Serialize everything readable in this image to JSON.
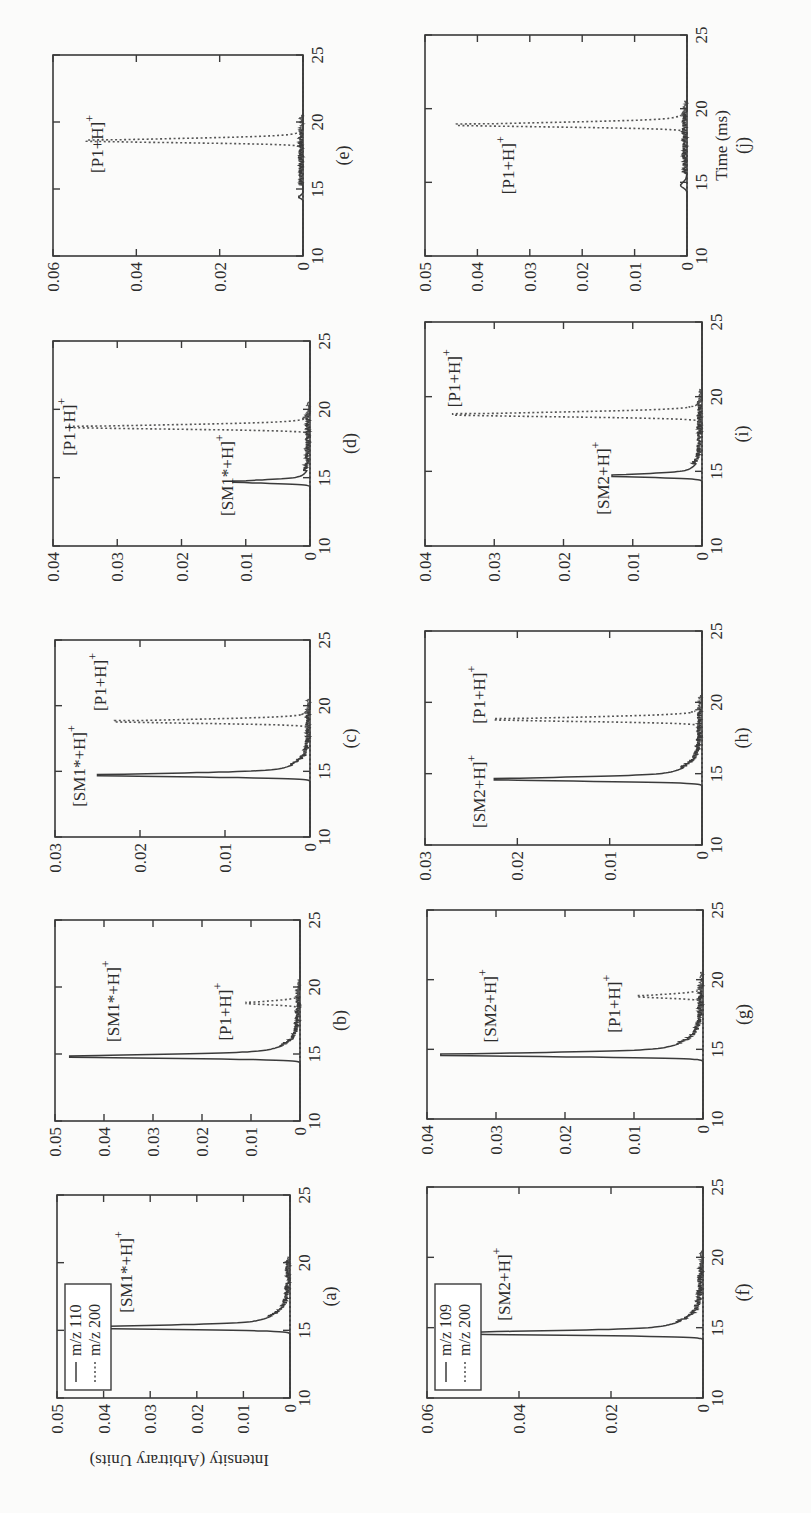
{
  "figure": {
    "y_axis_label": "Intensity (Arbitrary Units)",
    "x_axis_label": "Time (ms)",
    "colors": {
      "axis": "#3a3a3a",
      "solid_trace": "#3b3b3b",
      "dotted_trace": "#555555",
      "background": "#fbfbfa"
    }
  },
  "chart_data": [
    {
      "id": "a",
      "panel_label": "(a)",
      "type": "line",
      "xlabel": "",
      "ylabel": "Intensity (Arbitrary Units)",
      "xlim": [
        10,
        25
      ],
      "ylim": [
        0,
        0.05
      ],
      "xticks": [
        10,
        15,
        20,
        25
      ],
      "yticks": [
        0,
        0.01,
        0.02,
        0.03,
        0.04,
        0.05
      ],
      "ytick_labels": [
        "0",
        "0.01",
        "0.02",
        "0.03",
        "0.04",
        "0.05"
      ],
      "legend": [
        {
          "name": "m/z 110",
          "style": "solid"
        },
        {
          "name": "m/z 200",
          "style": "dotted"
        }
      ],
      "series": [
        {
          "name": "m/z 110",
          "style": "solid",
          "peak_time": 15.2,
          "peak_height": 0.047,
          "width": 0.35,
          "tail": 1.0
        },
        {
          "name": "m/z 200",
          "style": "dotted",
          "peak_time": 18.7,
          "peak_height": 0.0,
          "width": 0.3,
          "tail": 0.4
        }
      ],
      "annotations": [
        {
          "text": "[SM1*+H]",
          "sup": "+",
          "x": 16.3,
          "y": 0.034
        }
      ]
    },
    {
      "id": "b",
      "panel_label": "(b)",
      "type": "line",
      "xlim": [
        10,
        25
      ],
      "ylim": [
        0,
        0.05
      ],
      "xticks": [
        10,
        15,
        20,
        25
      ],
      "yticks": [
        0,
        0.01,
        0.02,
        0.03,
        0.04,
        0.05
      ],
      "ytick_labels": [
        "0",
        "0.01",
        "0.02",
        "0.03",
        "0.04",
        "0.05"
      ],
      "series": [
        {
          "name": "m/z 110",
          "style": "solid",
          "peak_time": 14.8,
          "peak_height": 0.047,
          "width": 0.35,
          "tail": 0.9
        },
        {
          "name": "m/z 200",
          "style": "dotted",
          "peak_time": 18.8,
          "peak_height": 0.011,
          "width": 0.35,
          "tail": 0.3
        }
      ],
      "annotations": [
        {
          "text": "[SM1*+H]",
          "sup": "+",
          "x": 15.9,
          "y": 0.037
        },
        {
          "text": "[P1+H]",
          "sup": "+",
          "x": 16.0,
          "y": 0.014
        }
      ]
    },
    {
      "id": "c",
      "panel_label": "(c)",
      "type": "line",
      "xlim": [
        10,
        25
      ],
      "ylim": [
        0,
        0.03
      ],
      "xticks": [
        10,
        15,
        20,
        25
      ],
      "yticks": [
        0,
        0.01,
        0.02,
        0.03
      ],
      "ytick_labels": [
        "0",
        "0.01",
        "0.02",
        "0.03"
      ],
      "series": [
        {
          "name": "m/z 110",
          "style": "solid",
          "peak_time": 14.7,
          "peak_height": 0.025,
          "width": 0.35,
          "tail": 0.9
        },
        {
          "name": "m/z 200",
          "style": "dotted",
          "peak_time": 18.8,
          "peak_height": 0.023,
          "width": 0.4,
          "tail": 0.3
        }
      ],
      "annotations": [
        {
          "text": "[SM1*+H]",
          "sup": "+",
          "x": 12.3,
          "y": 0.0265
        },
        {
          "text": "[P1+H]",
          "sup": "+",
          "x": 19.6,
          "y": 0.024
        }
      ]
    },
    {
      "id": "d",
      "panel_label": "(d)",
      "type": "line",
      "xlim": [
        10,
        25
      ],
      "ylim": [
        0,
        0.04
      ],
      "xticks": [
        10,
        15,
        20,
        25
      ],
      "yticks": [
        0,
        0.01,
        0.02,
        0.03,
        0.04
      ],
      "ytick_labels": [
        "0",
        "0.01",
        "0.02",
        "0.03",
        "0.04"
      ],
      "series": [
        {
          "name": "m/z 110",
          "style": "solid",
          "peak_time": 14.7,
          "peak_height": 0.012,
          "width": 0.3,
          "tail": 0.6
        },
        {
          "name": "m/z 200",
          "style": "dotted",
          "peak_time": 18.7,
          "peak_height": 0.038,
          "width": 0.4,
          "tail": 0.3
        }
      ],
      "annotations": [
        {
          "text": "[SM1*+H]",
          "sup": "+",
          "x": 12.2,
          "y": 0.012
        },
        {
          "text": "[P1+H]",
          "sup": "+",
          "x": 16.6,
          "y": 0.0365
        }
      ]
    },
    {
      "id": "e",
      "panel_label": "(e)",
      "type": "line",
      "xlim": [
        10,
        25
      ],
      "ylim": [
        0,
        0.06
      ],
      "xticks": [
        10,
        15,
        20,
        25
      ],
      "yticks": [
        0,
        0.02,
        0.04,
        0.06
      ],
      "ytick_labels": [
        "0",
        "0.02",
        "0.04",
        "0.06"
      ],
      "series": [
        {
          "name": "m/z 110",
          "style": "solid",
          "peak_time": 14.4,
          "peak_height": 0.001,
          "width": 0.3,
          "tail": 0.2
        },
        {
          "name": "m/z 200",
          "style": "dotted",
          "peak_time": 18.6,
          "peak_height": 0.052,
          "width": 0.4,
          "tail": 0.3
        }
      ],
      "annotations": [
        {
          "text": "[P1+H]",
          "sup": "+",
          "x": 16.2,
          "y": 0.048
        }
      ]
    },
    {
      "id": "f",
      "panel_label": "(f)",
      "type": "line",
      "xlim": [
        10,
        25
      ],
      "ylim": [
        0,
        0.06
      ],
      "xticks": [
        10,
        15,
        20,
        25
      ],
      "yticks": [
        0,
        0.02,
        0.04,
        0.06
      ],
      "ytick_labels": [
        "0",
        "0.02",
        "0.04",
        "0.06"
      ],
      "legend": [
        {
          "name": "m/z 109",
          "style": "solid"
        },
        {
          "name": "m/z 200",
          "style": "dotted"
        }
      ],
      "series": [
        {
          "name": "m/z 109",
          "style": "solid",
          "peak_time": 14.6,
          "peak_height": 0.058,
          "width": 0.35,
          "tail": 1.0
        },
        {
          "name": "m/z 200",
          "style": "dotted",
          "peak_time": 18.7,
          "peak_height": 0.0,
          "width": 0.3,
          "tail": 0.3
        }
      ],
      "annotations": [
        {
          "text": "[SM2+H]",
          "sup": "+",
          "x": 15.5,
          "y": 0.042
        }
      ]
    },
    {
      "id": "g",
      "panel_label": "(g)",
      "type": "line",
      "xlim": [
        10,
        25
      ],
      "ylim": [
        0,
        0.04
      ],
      "xticks": [
        10,
        15,
        20,
        25
      ],
      "yticks": [
        0,
        0.01,
        0.02,
        0.03,
        0.04
      ],
      "ytick_labels": [
        "0",
        "0.01",
        "0.02",
        "0.03",
        "0.04"
      ],
      "series": [
        {
          "name": "m/z 109",
          "style": "solid",
          "peak_time": 14.6,
          "peak_height": 0.038,
          "width": 0.35,
          "tail": 1.0
        },
        {
          "name": "m/z 200",
          "style": "dotted",
          "peak_time": 18.8,
          "peak_height": 0.0095,
          "width": 0.35,
          "tail": 0.3
        }
      ],
      "annotations": [
        {
          "text": "[SM2+H]",
          "sup": "+",
          "x": 15.5,
          "y": 0.03
        },
        {
          "text": "[P1+H]",
          "sup": "+",
          "x": 16.2,
          "y": 0.012
        }
      ]
    },
    {
      "id": "h",
      "panel_label": "(h)",
      "type": "line",
      "xlim": [
        10,
        25
      ],
      "ylim": [
        0,
        0.03
      ],
      "xticks": [
        10,
        15,
        20,
        25
      ],
      "yticks": [
        0,
        0.01,
        0.02,
        0.03
      ],
      "ytick_labels": [
        "0",
        "0.01",
        "0.02",
        "0.03"
      ],
      "series": [
        {
          "name": "m/z 109",
          "style": "solid",
          "peak_time": 14.6,
          "peak_height": 0.0225,
          "width": 0.35,
          "tail": 1.0
        },
        {
          "name": "m/z 200",
          "style": "dotted",
          "peak_time": 18.8,
          "peak_height": 0.0225,
          "width": 0.4,
          "tail": 0.3
        }
      ],
      "annotations": [
        {
          "text": "[SM2+H]",
          "sup": "+",
          "x": 11.2,
          "y": 0.0235
        },
        {
          "text": "[P1+H]",
          "sup": "+",
          "x": 18.5,
          "y": 0.0235
        }
      ]
    },
    {
      "id": "i",
      "panel_label": "(i)",
      "type": "line",
      "xlim": [
        10,
        25
      ],
      "ylim": [
        0,
        0.04
      ],
      "xticks": [
        10,
        15,
        20,
        25
      ],
      "yticks": [
        0,
        0.01,
        0.02,
        0.03,
        0.04
      ],
      "ytick_labels": [
        "0",
        "0.01",
        "0.02",
        "0.03",
        "0.04"
      ],
      "series": [
        {
          "name": "m/z 109",
          "style": "solid",
          "peak_time": 14.7,
          "peak_height": 0.013,
          "width": 0.3,
          "tail": 0.8
        },
        {
          "name": "m/z 200",
          "style": "dotted",
          "peak_time": 18.8,
          "peak_height": 0.036,
          "width": 0.4,
          "tail": 0.3
        }
      ],
      "annotations": [
        {
          "text": "[SM2+H]",
          "sup": "+",
          "x": 12.1,
          "y": 0.0135
        },
        {
          "text": "[P1+H]",
          "sup": "+",
          "x": 19.3,
          "y": 0.035
        }
      ]
    },
    {
      "id": "j",
      "panel_label": "(j)",
      "type": "line",
      "xlabel": "Time (ms)",
      "xlim": [
        10,
        25
      ],
      "ylim": [
        0,
        0.05
      ],
      "xticks": [
        10,
        15,
        20,
        25
      ],
      "yticks": [
        0,
        0.01,
        0.02,
        0.03,
        0.04,
        0.05
      ],
      "ytick_labels": [
        "0",
        "0.01",
        "0.02",
        "0.03",
        "0.04",
        "0.05"
      ],
      "series": [
        {
          "name": "m/z 109",
          "style": "solid",
          "peak_time": 14.8,
          "peak_height": 0.0012,
          "width": 0.5,
          "tail": 0.6
        },
        {
          "name": "m/z 200",
          "style": "dotted",
          "peak_time": 18.9,
          "peak_height": 0.044,
          "width": 0.4,
          "tail": 0.3
        }
      ],
      "annotations": [
        {
          "text": "[P1+H]",
          "sup": "+",
          "x": 14.2,
          "y": 0.033
        }
      ]
    }
  ],
  "layout": {
    "panels": [
      {
        "id": "a",
        "u": 115,
        "v": 57,
        "w": 203,
        "h": 233
      },
      {
        "id": "b",
        "u": 392,
        "v": 55,
        "w": 201,
        "h": 245
      },
      {
        "id": "c",
        "u": 676,
        "v": 55,
        "w": 197,
        "h": 255
      },
      {
        "id": "d",
        "u": 967,
        "v": 53,
        "w": 205,
        "h": 257
      },
      {
        "id": "e",
        "u": 1257,
        "v": 53,
        "w": 201,
        "h": 250
      },
      {
        "id": "f",
        "u": 115,
        "v": 427,
        "w": 211,
        "h": 276
      },
      {
        "id": "g",
        "u": 394,
        "v": 427,
        "w": 209,
        "h": 276
      },
      {
        "id": "h",
        "u": 668,
        "v": 425,
        "w": 214,
        "h": 277
      },
      {
        "id": "i",
        "u": 967,
        "v": 425,
        "w": 224,
        "h": 277
      },
      {
        "id": "j",
        "u": 1257,
        "v": 425,
        "w": 221,
        "h": 262
      }
    ]
  }
}
